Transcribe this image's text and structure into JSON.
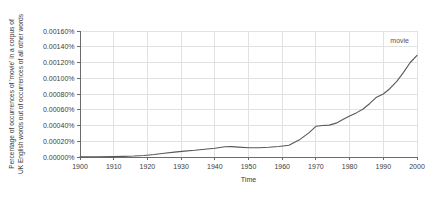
{
  "chart_data": {
    "type": "line",
    "title": "",
    "xlabel": "Time",
    "ylabel_line1": "Percentage of occurrences of 'movie' in a corpus of",
    "ylabel_line2": "UK English words out of occurrences of all other words",
    "xlim": [
      1900,
      2000
    ],
    "ylim": [
      0,
      0.0016
    ],
    "grid": true,
    "legend_position": "inline-right",
    "xticks": [
      1900,
      1910,
      1920,
      1930,
      1940,
      1950,
      1960,
      1970,
      1980,
      1990,
      2000
    ],
    "xtick_labels": [
      "1900",
      "1910",
      "1920",
      "1930",
      "1940",
      "1950",
      "1960",
      "1970",
      "1980",
      "1990",
      "2000"
    ],
    "yticks": [
      0.0,
      0.0002,
      0.0004,
      0.0006,
      0.0008,
      0.001,
      0.0012,
      0.0014,
      0.0016
    ],
    "ytick_labels": [
      "0.00000%",
      "0.00020%",
      "0.00040%",
      "0.00060%",
      "0.00080%",
      "0.00100%",
      "0.00120%",
      "0.00140%",
      "0.00160%"
    ],
    "series": [
      {
        "name": "movie",
        "color": "#585858",
        "x": [
          1900,
          1905,
          1910,
          1913,
          1916,
          1919,
          1922,
          1925,
          1928,
          1931,
          1934,
          1937,
          1940,
          1943,
          1945,
          1947,
          1950,
          1953,
          1956,
          1959,
          1962,
          1965,
          1968,
          1970,
          1972,
          1974,
          1976,
          1978,
          1980,
          1982,
          1984,
          1986,
          1988,
          1990,
          1992,
          1994,
          1996,
          1998,
          2000
        ],
        "y": [
          2e-06,
          3e-06,
          5e-06,
          8e-06,
          1.2e-05,
          2e-05,
          3.2e-05,
          4.8e-05,
          6.2e-05,
          7.5e-05,
          8.5e-05,
          9.8e-05,
          0.000112,
          0.00013,
          0.000132,
          0.000126,
          0.000118,
          0.000118,
          0.000124,
          0.000134,
          0.00015,
          0.000215,
          0.00031,
          0.00039,
          0.0004,
          0.000405,
          0.00043,
          0.000475,
          0.00052,
          0.00056,
          0.00061,
          0.00068,
          0.00076,
          0.0008,
          0.00087,
          0.00096,
          0.001075,
          0.0012,
          0.00129
        ]
      }
    ]
  }
}
